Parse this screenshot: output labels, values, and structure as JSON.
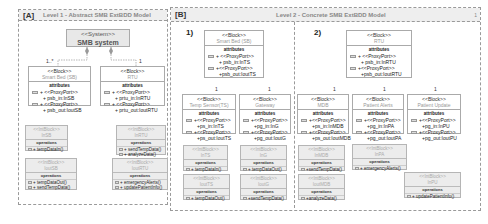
{
  "panelA": {
    "tag": "[A]",
    "title": "Level 1 - Abstract SMB ExtBDD Model",
    "system": {
      "stereotype": "<<System>>",
      "name": "SMB system"
    },
    "multiplicity_sb": "1..*",
    "multiplicity_rtu": "1",
    "blocks": [
      {
        "stereotype": "<<Block>>",
        "name": "Smart Bed (SB)",
        "section": "attributes",
        "ports": [
          {
            "line1": "+ <<ProxyPort>>",
            "line2": "+ psb_in:InSB"
          },
          {
            "line1": "+ <<ProxyPort>>",
            "line2": "+ psb_out:IoutSB"
          }
        ]
      },
      {
        "stereotype": "<<Block>>",
        "name": "RTU",
        "section": "attributes",
        "ports": [
          {
            "line1": "+ <<ProxyPort>>",
            "line2": "+ prtu_in:InRTU"
          },
          {
            "line1": "+ <<ProxyPort>>",
            "line2": "+ prtu_out:IoutRTU"
          }
        ]
      }
    ],
    "interfaces": [
      {
        "stereotype": "<<IntBlock>>",
        "name": "InSB",
        "section": "operations",
        "ops": [
          "+ tempDataIn()"
        ]
      },
      {
        "stereotype": "<<IntBlock>>",
        "name": "IoutSB",
        "section": "operations",
        "ops": [
          "+ tempDataOut()",
          "+ sendTempData()"
        ]
      },
      {
        "stereotype": "<<IntBlock>>",
        "name": "InRTU",
        "section": "operations",
        "ops": [
          "+ sendTempData()",
          "+ analyzeData()"
        ]
      },
      {
        "stereotype": "<<IntBlock>>",
        "name": "IoutRTU",
        "section": "operations",
        "ops": [
          "+ emergencyAlerts()",
          "+ updatePatientInfo()"
        ]
      }
    ]
  },
  "panelB": {
    "tag": "[B]",
    "title": "Level 2 - Concrete SMB ExtBDD Model",
    "corner": "1",
    "sub1": {
      "label": "1)",
      "parent": {
        "stereotype": "<<Block>>",
        "name": "Smart Bed (SB)",
        "section": "attributes",
        "ports": [
          {
            "line1": "+ <<ProxyPort>>",
            "line2": "+ psb_in:InTS"
          },
          {
            "line1": "+<<ProxyPort>>",
            "line2": "+psb_out:IoutTS"
          }
        ]
      },
      "mult_left": "1",
      "mult_right": "1",
      "children": [
        {
          "stereotype": "<<Block>>",
          "name": "Temp Sensor(TS)",
          "section": "attributes",
          "ports": [
            {
              "line1": "+<<ProxyPort>>",
              "line2": "+ps_in:InTS"
            },
            {
              "line1": "+<<ProxyPort>>",
              "line2": "+ps_out:IoutTS"
            }
          ]
        },
        {
          "stereotype": "<<Block>>",
          "name": "Gateway",
          "section": "attributes",
          "ports": [
            {
              "line1": "+<<ProxyPort>>",
              "line2": "+pg_in:InG"
            },
            {
              "line1": "+<<ProxyPort>>",
              "line2": "+pg_out:IoutG"
            }
          ]
        }
      ],
      "interfaces": [
        {
          "stereotype": "<<IntBlock>>",
          "name": "InTS",
          "section": "operations",
          "ops": [
            "+ tempDataIn()"
          ]
        },
        {
          "stereotype": "<<IntBlock>>",
          "name": "InG",
          "section": "operations",
          "ops": [
            "+ tempDataOut()"
          ]
        },
        {
          "stereotype": "<<IntBlock>>",
          "name": "IoutTS",
          "section": "operations",
          "ops": [
            "+ tempDataOut()"
          ]
        },
        {
          "stereotype": "<<IntBlock>>",
          "name": "IoutG",
          "section": "operations",
          "ops": [
            "+sendTempData()"
          ]
        }
      ]
    },
    "sub2": {
      "label": "2)",
      "parent": {
        "stereotype": "<<Block>>",
        "name": "RTU",
        "section": "attributes",
        "ports": [
          {
            "line1": "+ <<ProxyPort>>",
            "line2": "+ psb_in:InRTU"
          },
          {
            "line1": "+<<ProxyPort>>",
            "line2": "+psb_out:IoutRTU"
          }
        ]
      },
      "mult": [
        "1",
        "1",
        "1"
      ],
      "children": [
        {
          "stereotype": "<<Block>>",
          "name": "MDB",
          "section": "attributes",
          "ports": [
            {
              "line1": "+<<ProxyPort>>",
              "line2": "+ps_in:InMDB"
            },
            {
              "line1": "+<<ProxyPort>>",
              "line2": "+ps_out:IoutMDB"
            }
          ]
        },
        {
          "stereotype": "<<Block>>",
          "name": "Patient Alerts",
          "section": "attributes",
          "ports": [
            {
              "line1": "+<<ProxyPort>>",
              "line2": "+pg_in:InPA"
            },
            {
              "line1": "+<<ProxyPort>>",
              "line2": "+pg_out:IoutPA"
            }
          ]
        },
        {
          "stereotype": "<<Block>>",
          "name": "Patient Update",
          "section": "attributes",
          "ports": [
            {
              "line1": "+<<ProxyPort>>",
              "line2": "+pg_in:InPU"
            },
            {
              "line1": "+<<ProxyPort>>",
              "line2": "+pg_out:IoutPU"
            }
          ]
        }
      ],
      "interfaces": [
        {
          "stereotype": "<<IntBlock>>",
          "name": "InMDB",
          "section": "operations",
          "ops": [
            "+sendTempData()"
          ]
        },
        {
          "stereotype": "<<IntBlock>>",
          "name": "InPA",
          "section": "operations",
          "ops": [
            "+ emergencyAlerts()"
          ]
        },
        {
          "stereotype": "<<IntBlock>>",
          "name": "IoutMDB",
          "section": "operations",
          "ops": [
            "+analyzeData()"
          ]
        },
        {
          "stereotype": "<<IntBlock>>",
          "name": "InPU",
          "section": "operations",
          "ops": [
            "+ updatePatientInfo()"
          ]
        }
      ]
    }
  }
}
